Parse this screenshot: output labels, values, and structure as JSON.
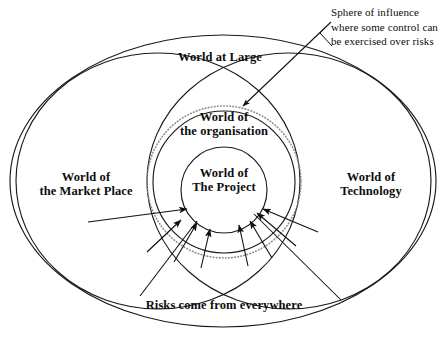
{
  "diagram": {
    "type": "concentric-venn",
    "background_color": "#ffffff",
    "stroke_color": "#1a1a1a",
    "dotted_color": "#8a8a8a",
    "text_color": "#0d0d0d",
    "labels": {
      "world_at_large": "World at Large",
      "world_of_organisation": "World of\nthe organisation",
      "world_of_project": "World of\nThe Project",
      "world_of_market_place": "World of\nthe Market Place",
      "world_of_technology": "World of\nTechnology",
      "risks_caption": "Risks come from everywhere",
      "sphere_of_influence": "Sphere of influence\nwhere some control can\nbe exercised over risks"
    },
    "shapes": {
      "outer_ellipse": {
        "cx": 223,
        "cy": 181,
        "rx": 213,
        "ry": 146
      },
      "left_circle": {
        "cx": 158,
        "cy": 181,
        "rx": 142,
        "ry": 128
      },
      "right_circle": {
        "cx": 289,
        "cy": 181,
        "rx": 142,
        "ry": 128
      },
      "dotted_circle": {
        "cx": 224,
        "cy": 182,
        "rx": 77,
        "ry": 76
      },
      "organisation_circle": {
        "cx": 224,
        "cy": 182,
        "rx": 71,
        "ry": 71
      },
      "project_circle": {
        "cx": 224,
        "cy": 190,
        "rx": 43,
        "ry": 43
      }
    },
    "annotations": [
      {
        "name": "sphere-of-influence-callout",
        "from_x": 331,
        "from_y": 22,
        "to_x": 242,
        "to_y": 107
      },
      {
        "name": "risks-callout-left",
        "from_x": 140,
        "from_y": 296,
        "to_x": 196,
        "to_y": 219
      },
      {
        "name": "risks-callout-right",
        "from_x": 341,
        "from_y": 300,
        "to_x": 253,
        "to_y": 213
      }
    ],
    "risk_arrows": [
      {
        "from_x": 88,
        "from_y": 222,
        "to_x": 187,
        "to_y": 209
      },
      {
        "from_x": 147,
        "from_y": 252,
        "to_x": 180,
        "to_y": 219
      },
      {
        "from_x": 174,
        "from_y": 262,
        "to_x": 196,
        "to_y": 222
      },
      {
        "from_x": 200,
        "from_y": 268,
        "to_x": 209,
        "to_y": 228
      },
      {
        "from_x": 248,
        "from_y": 266,
        "to_x": 238,
        "to_y": 224
      },
      {
        "from_x": 272,
        "from_y": 258,
        "to_x": 249,
        "to_y": 220
      },
      {
        "from_x": 296,
        "from_y": 246,
        "to_x": 256,
        "to_y": 212
      },
      {
        "from_x": 318,
        "from_y": 232,
        "to_x": 262,
        "to_y": 208
      }
    ]
  }
}
